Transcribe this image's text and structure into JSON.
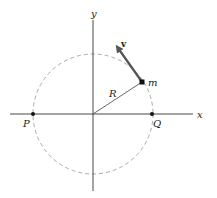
{
  "diagram": {
    "title": "",
    "labels": {
      "x_axis": "x",
      "y_axis": "y",
      "point_left": "P",
      "point_right": "Q",
      "radius": "R",
      "mass": "m",
      "velocity": "v"
    },
    "colors": {
      "axes": "#333333",
      "circle": "#aaaaaa",
      "radius_line": "#555555",
      "velocity_arrow": "#555555",
      "points": "#111111"
    },
    "geometry": {
      "origin": [
        93,
        114
      ],
      "radius_px": 60,
      "mass_position": [
        142,
        82
      ],
      "velocity_tip": [
        115,
        44
      ]
    }
  }
}
